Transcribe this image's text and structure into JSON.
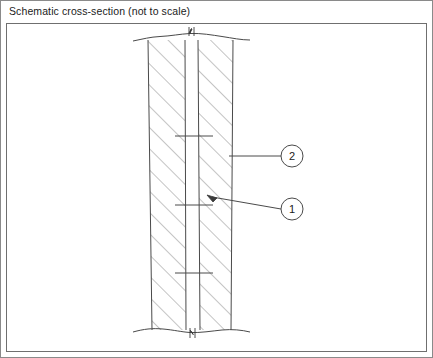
{
  "figure": {
    "title": "Schematic cross-section (not to scale)",
    "type": "technical-line-drawing",
    "style": "patent-schematic",
    "orientation": "vertical-wall-section",
    "line_color": "#4a4a4a",
    "hatch_color": "#8a8a8a",
    "border_color": "#8a8a8a",
    "frame_color": "#6f6f6f",
    "background_color": "#ffffff",
    "text_color": "#1b1b1b"
  },
  "frame": {
    "outer": {
      "x": 0,
      "y": 0,
      "width": 433,
      "height": 358
    },
    "inner": {
      "x": 6,
      "y": 23,
      "width": 421,
      "height": 329
    }
  },
  "section": {
    "description": "Vertical wall cross-section with two hatched layers separated by a narrow unhatched cavity",
    "break_lines": {
      "top_y": 37,
      "bottom_y": 330,
      "left_x": 133,
      "right_x": 250,
      "symbol": "zigzag-break"
    },
    "boundaries": {
      "outer_left_top_x": 148,
      "outer_left_bottom_x": 152,
      "inner_left_top_x": 185,
      "inner_left_bottom_x": 186,
      "inner_right_top_x": 198,
      "inner_right_bottom_x": 200,
      "outer_right_top_x": 233,
      "outer_right_bottom_x": 231,
      "top_y": 40,
      "bottom_y": 330
    },
    "layers": [
      {
        "name": "left-hatched-layer",
        "hatched": true,
        "hatch_direction": "up-right"
      },
      {
        "name": "central-cavity",
        "hatched": false
      },
      {
        "name": "right-hatched-layer",
        "hatched": true,
        "hatch_direction": "up-right"
      }
    ],
    "tick_marks": [
      {
        "y": 136,
        "x1": 175,
        "x2": 213
      },
      {
        "y": 205,
        "x1": 175,
        "x2": 213
      },
      {
        "y": 273,
        "x1": 175,
        "x2": 213
      }
    ]
  },
  "callouts": [
    {
      "id": "callout-2",
      "label": "2",
      "balloon": {
        "cx": 292,
        "cy": 156,
        "r": 11
      },
      "leader": {
        "type": "horizontal",
        "x1": 281,
        "y1": 156,
        "x2": 229,
        "y2": 156
      },
      "arrow": false,
      "points_to": "right-hatched-layer outer edge"
    },
    {
      "id": "callout-1",
      "label": "1",
      "balloon": {
        "cx": 292,
        "cy": 209,
        "r": 11
      },
      "leader": {
        "type": "slanted",
        "x1": 281,
        "y1": 209,
        "x2": 210,
        "y2": 197
      },
      "arrow": true,
      "points_to": "central cavity / inner layer"
    }
  ]
}
